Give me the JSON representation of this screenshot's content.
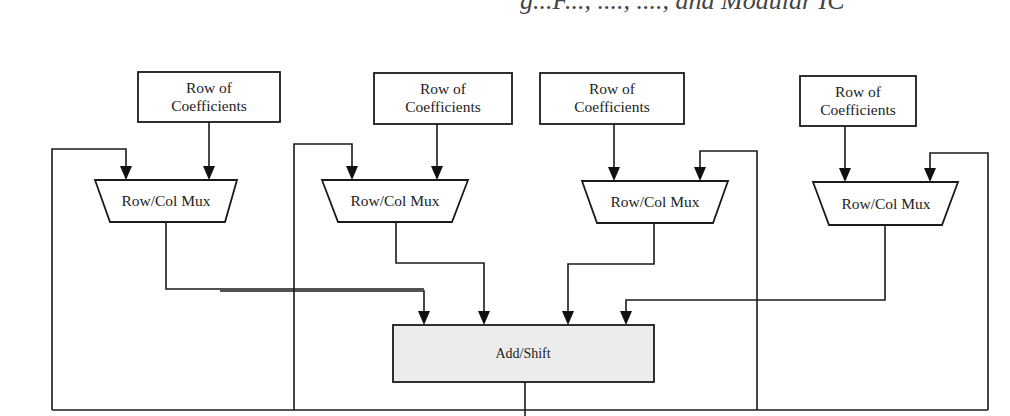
{
  "header": {
    "clipped_title": "g...F..., ...., ...., and Modular IC"
  },
  "diagram": {
    "type": "block-diagram",
    "coefficient_blocks": [
      {
        "id": "coef-1",
        "line1": "Row of",
        "line2": "Coefficients"
      },
      {
        "id": "coef-2",
        "line1": "Row of",
        "line2": "Coefficients"
      },
      {
        "id": "coef-3",
        "line1": "Row of",
        "line2": "Coefficients"
      },
      {
        "id": "coef-4",
        "line1": "Row of",
        "line2": "Coefficients"
      }
    ],
    "mux_blocks": [
      {
        "id": "mux-1",
        "label": "Row/Col Mux"
      },
      {
        "id": "mux-2",
        "label": "Row/Col Mux"
      },
      {
        "id": "mux-3",
        "label": "Row/Col Mux"
      },
      {
        "id": "mux-4",
        "label": "Row/Col Mux"
      }
    ],
    "adder": {
      "id": "add-shift",
      "label": "Add/Shift"
    },
    "connections": [
      {
        "from": "coef-1",
        "to": "mux-1"
      },
      {
        "from": "coef-2",
        "to": "mux-2"
      },
      {
        "from": "coef-3",
        "to": "mux-3"
      },
      {
        "from": "coef-4",
        "to": "mux-4"
      },
      {
        "from": "mux-1",
        "to": "add-shift"
      },
      {
        "from": "mux-2",
        "to": "add-shift"
      },
      {
        "from": "mux-3",
        "to": "add-shift"
      },
      {
        "from": "mux-4",
        "to": "add-shift"
      },
      {
        "from": "add-shift",
        "to": "feedback-bus"
      },
      {
        "from": "feedback-bus",
        "to": "mux-1"
      },
      {
        "from": "feedback-bus",
        "to": "mux-2"
      },
      {
        "from": "feedback-bus",
        "to": "mux-3"
      },
      {
        "from": "feedback-bus",
        "to": "mux-4"
      },
      {
        "from": "feedback-bus",
        "to": "add-shift"
      }
    ],
    "colors": {
      "stroke": "#1a1a1a",
      "adder_fill": "#ececec",
      "background": "#ffffff"
    }
  }
}
